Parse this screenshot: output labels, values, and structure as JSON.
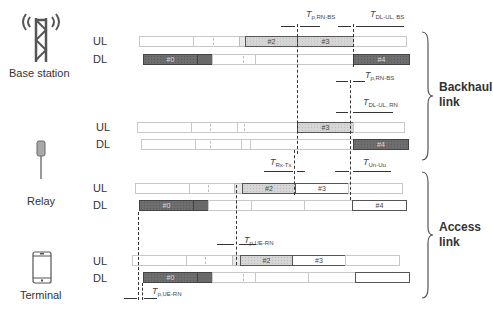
{
  "nodes": {
    "base_station": {
      "label": "Base station",
      "icon": "antenna-tower-icon"
    },
    "relay": {
      "label": "Relay",
      "icon": "relay-antenna-icon"
    },
    "terminal": {
      "label": "Terminal",
      "icon": "mobile-phone-icon"
    }
  },
  "row_labels": {
    "ul": "UL",
    "dl": "DL"
  },
  "subframes": {
    "s0": "#0",
    "s2": "#2",
    "s3": "#3",
    "s4": "#4"
  },
  "timing_labels": {
    "tp_rn_bs": {
      "main": "T",
      "sub": "p,RN-BS"
    },
    "tdl_ul_bs": {
      "main": "T",
      "sub": "DL-UL, BS"
    },
    "tdl_ul_rn": {
      "main": "T",
      "sub": "DL-UL, RN"
    },
    "trx_tx": {
      "main": "T",
      "sub": "Rx-Tx"
    },
    "tun_uu": {
      "main": "T",
      "sub": "Un-Uu"
    },
    "tp_ue_rn": {
      "main": "T",
      "sub": "p,UE-RN"
    }
  },
  "links": {
    "backhaul": {
      "line1": "Backhaul",
      "line2": "link"
    },
    "access": {
      "line1": "Access",
      "line2": "link"
    }
  },
  "colors": {
    "dark_subframe": "#6e6e6e",
    "light_subframe": "#d6d6d6",
    "empty_subframe": "#ffffff",
    "line": "#333333"
  }
}
